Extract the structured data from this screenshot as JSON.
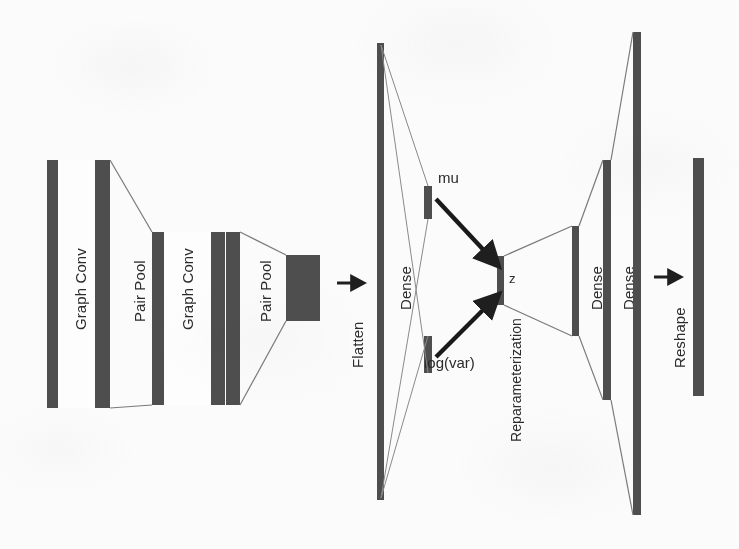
{
  "figure": {
    "background_color": "#fbfbfb",
    "block_color": "#4e4e4e",
    "line_color": "#6b6b6b",
    "text_color": "#2b2b2b"
  },
  "encoder": {
    "blocks": [
      {
        "id": "graph-conv-1",
        "label": "Graph Conv"
      },
      {
        "id": "pair-pool-1",
        "label": "Pair Pool"
      },
      {
        "id": "graph-conv-2",
        "label": "Graph Conv"
      },
      {
        "id": "pair-pool-2",
        "label": "Pair Pool"
      }
    ]
  },
  "transitions": {
    "flatten": {
      "label": "Flatten",
      "icon": "arrow-right-icon"
    },
    "reshape": {
      "label": "Reshape",
      "icon": "arrow-right-icon"
    }
  },
  "latent": {
    "dense_in": {
      "label": "Dense"
    },
    "mu": {
      "label": "mu"
    },
    "logvar": {
      "label": "log(var)"
    },
    "z": {
      "label": "z"
    },
    "reparameterization": {
      "label": "Reparameterization"
    },
    "arrows": [
      {
        "id": "mu-to-z-arrow",
        "icon": "arrow-down-right-icon"
      },
      {
        "id": "logvar-to-z-arrow",
        "icon": "arrow-up-right-icon"
      }
    ]
  },
  "decoder": {
    "blocks": [
      {
        "id": "dense-dec-1",
        "label": "Dense"
      },
      {
        "id": "dense-dec-2",
        "label": "Dense"
      },
      {
        "id": "dense-dec-3",
        "label": "Dense"
      }
    ],
    "output": {
      "id": "output-bar",
      "label": ""
    }
  }
}
